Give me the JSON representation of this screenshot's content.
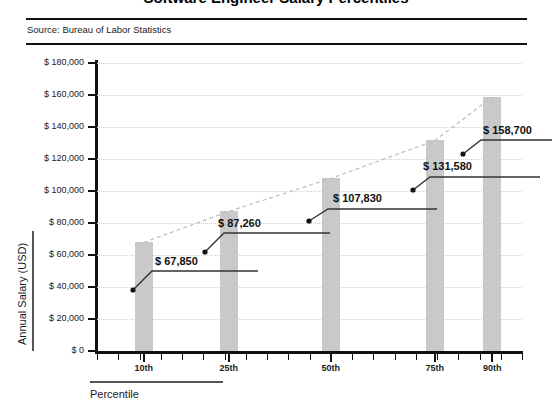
{
  "header": {
    "title": "Software Engineer Salary Percentiles",
    "source": "Source: Bureau of Labor Statistics"
  },
  "chart_data": {
    "type": "bar",
    "title": "Software Engineer Salary Percentiles",
    "xlabel": "Percentile",
    "ylabel": "Annual Salary (USD)",
    "categories": [
      "10th",
      "25th",
      "50th",
      "75th",
      "90th"
    ],
    "values": [
      67850,
      87260,
      107830,
      131580,
      158700
    ],
    "value_labels": [
      "$ 67,850",
      "$ 87,260",
      "$ 107,830",
      "$ 131,580",
      "$ 158,700"
    ],
    "ylim": [
      0,
      180000
    ],
    "ytick_values": [
      0,
      20000,
      40000,
      60000,
      80000,
      100000,
      120000,
      140000,
      160000,
      180000
    ],
    "ytick_labels": [
      "$ 0",
      "$ 20,000",
      "$ 40,000",
      "$ 60,000",
      "$ 80,000",
      "$ 100,000",
      "$ 120,000",
      "$ 140,000",
      "$ 160,000",
      "$ 180,000"
    ],
    "grid": true,
    "legend": false,
    "series": [
      {
        "name": "Annual Salary (USD)",
        "type": "bar",
        "color": "#c9c9c9",
        "values": [
          67850,
          87260,
          107830,
          131580,
          158700
        ]
      },
      {
        "name": "Trend",
        "type": "line",
        "style": "dashed",
        "color": "#bdbdbd",
        "values": [
          67850,
          87260,
          107830,
          131580,
          158700
        ]
      }
    ]
  },
  "annotations": [
    {
      "text": "$ 67,850",
      "value": 67850
    },
    {
      "text": "$ 87,260",
      "value": 87260
    },
    {
      "text": "$ 107,830",
      "value": 107830
    },
    {
      "text": "$ 131,580",
      "value": 131580
    },
    {
      "text": "$ 158,700",
      "value": 158700
    }
  ],
  "colors": {
    "bar": "#c9c9c9",
    "trendline": "#bdbdbd",
    "grid": "#cfcfcf",
    "axis": "#111111",
    "text": "#1a1a1a"
  }
}
